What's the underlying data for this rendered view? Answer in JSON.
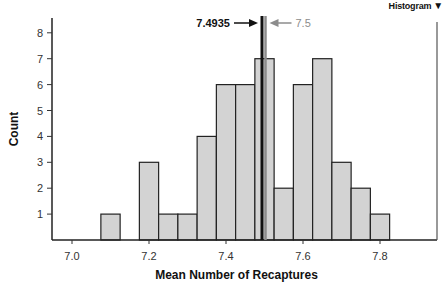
{
  "menu": {
    "label": "Histogram",
    "icon": "dropdown-triangle-icon"
  },
  "annotations": {
    "observed": {
      "label": "7.4935",
      "value": 7.4935,
      "color": "#111111"
    },
    "reference": {
      "label": "7.5",
      "value": 7.5,
      "color": "#8c8c8c"
    }
  },
  "chart_data": {
    "type": "bar",
    "title": "",
    "xlabel": "Mean Number of Recaptures",
    "ylabel": "Count",
    "bin_width": 0.05,
    "bin_start": 7.075,
    "categories": [
      "7.075-7.125",
      "7.125-7.175",
      "7.175-7.225",
      "7.225-7.275",
      "7.275-7.325",
      "7.325-7.375",
      "7.375-7.425",
      "7.425-7.475",
      "7.475-7.525",
      "7.525-7.575",
      "7.575-7.625",
      "7.625-7.675",
      "7.675-7.725",
      "7.725-7.775",
      "7.775-7.825"
    ],
    "values": [
      1,
      0,
      3,
      1,
      1,
      4,
      6,
      6,
      7,
      2,
      6,
      7,
      3,
      2,
      1
    ],
    "xticks": [
      "7.0",
      "7.2",
      "7.4",
      "7.6",
      "7.8"
    ],
    "xtick_values": [
      7.0,
      7.2,
      7.4,
      7.6,
      7.8
    ],
    "yticks": [
      "1",
      "2",
      "3",
      "4",
      "5",
      "6",
      "7",
      "8"
    ],
    "xlim": [
      6.95,
      7.96
    ],
    "ylim": [
      0,
      8.4
    ],
    "grid": false,
    "bar_color": "#d3d3d3",
    "edge_color": "#222222",
    "vlines": [
      {
        "x": 7.4935,
        "label": "7.4935",
        "color": "#111111"
      },
      {
        "x": 7.5,
        "label": "7.5",
        "color": "#8c8c8c"
      }
    ]
  }
}
